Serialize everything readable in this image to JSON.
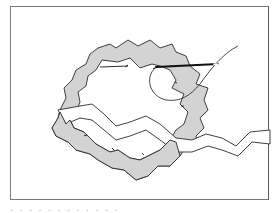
{
  "figure": {
    "colors": {
      "trim_fill": "#d3d3d3",
      "outline": "#2a2a2a",
      "frame": "#7a7a7a",
      "background": "#ffffff"
    },
    "elements": [
      "ric-rac ring",
      "ric-rac tail",
      "needle",
      "thread loop",
      "stitch marks"
    ]
  },
  "caption": {
    "text": "· · · · ·   · · · ·   · ·   ·"
  }
}
